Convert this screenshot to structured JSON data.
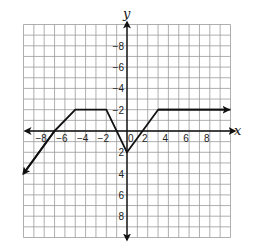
{
  "chart_data": {
    "type": "line",
    "title": "",
    "xlabel": "x",
    "ylabel": "y",
    "xlim": [
      -10,
      10
    ],
    "ylim": [
      -10,
      10
    ],
    "grid": true,
    "x_ticks": [
      -8,
      -6,
      -4,
      -2,
      0,
      2,
      4,
      6,
      8
    ],
    "y_ticks": [
      -8,
      -6,
      -4,
      -2,
      2,
      4,
      6,
      8
    ],
    "tick_labels": {
      "x": [
        "−8",
        "−6",
        "−4",
        "−2",
        "0",
        "2",
        "4",
        "6",
        "8"
      ],
      "y": [
        "8",
        "6",
        "4",
        "2",
        "−2",
        "−4",
        "−6",
        "−8"
      ]
    },
    "series": [
      {
        "name": "piecewise function",
        "points": [
          [
            -10,
            -4
          ],
          [
            -7,
            0
          ],
          [
            -5,
            2
          ],
          [
            -2,
            2
          ],
          [
            0,
            -2
          ],
          [
            3,
            2
          ],
          [
            10,
            2
          ]
        ],
        "left_end": "arrow",
        "right_end": "arrow"
      }
    ],
    "legend": null
  },
  "labels": {
    "x_axis": "x",
    "y_axis": "y"
  },
  "colors": {
    "grid": "#9a9a9a",
    "axis": "#111111",
    "line": "#111111"
  }
}
